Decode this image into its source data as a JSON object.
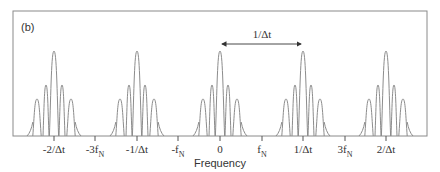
{
  "panel_label": "(b)",
  "xlabel": "Frequency",
  "spacing_annotation": "1/Δt",
  "colors": {
    "frame": "#8a8a8a",
    "curve": "#8c8c8c",
    "text": "#333333",
    "arrow": "#333333"
  },
  "ticks": [
    {
      "x": 54,
      "main": "-2/Δt",
      "sub": ""
    },
    {
      "x": 95,
      "main": "-3f",
      "sub": "N"
    },
    {
      "x": 137,
      "main": "-1/Δt",
      "sub": ""
    },
    {
      "x": 178,
      "main": "-f",
      "sub": "N"
    },
    {
      "x": 220,
      "main": "0",
      "sub": ""
    },
    {
      "x": 262,
      "main": "f",
      "sub": "N"
    },
    {
      "x": 303,
      "main": "1/Δt",
      "sub": ""
    },
    {
      "x": 345,
      "main": "3f",
      "sub": "N"
    },
    {
      "x": 386,
      "main": "2/Δt",
      "sub": ""
    }
  ],
  "peaks": [
    {
      "center_label": "-2/Δt",
      "x": 54
    },
    {
      "center_label": "-1/Δt",
      "x": 137
    },
    {
      "center_label": "0",
      "x": 220
    },
    {
      "center_label": "1/Δt",
      "x": 303
    },
    {
      "center_label": "2/Δt",
      "x": 386
    }
  ],
  "chart_data": {
    "type": "line",
    "title": "(b)",
    "xlabel": "Frequency",
    "ylabel": "",
    "x_tick_labels": [
      "-2/Δt",
      "-3f_N",
      "-1/Δt",
      "-f_N",
      "0",
      "f_N",
      "1/Δt",
      "3f_N",
      "2/Δt"
    ],
    "peak_centers": [
      "-2/Δt",
      "-1/Δt",
      "0",
      "1/Δt",
      "2/Δt"
    ],
    "annotation": {
      "text": "1/Δt",
      "type": "double-arrow",
      "from": "0",
      "to": "1/Δt"
    },
    "grid": false,
    "legend": null
  }
}
